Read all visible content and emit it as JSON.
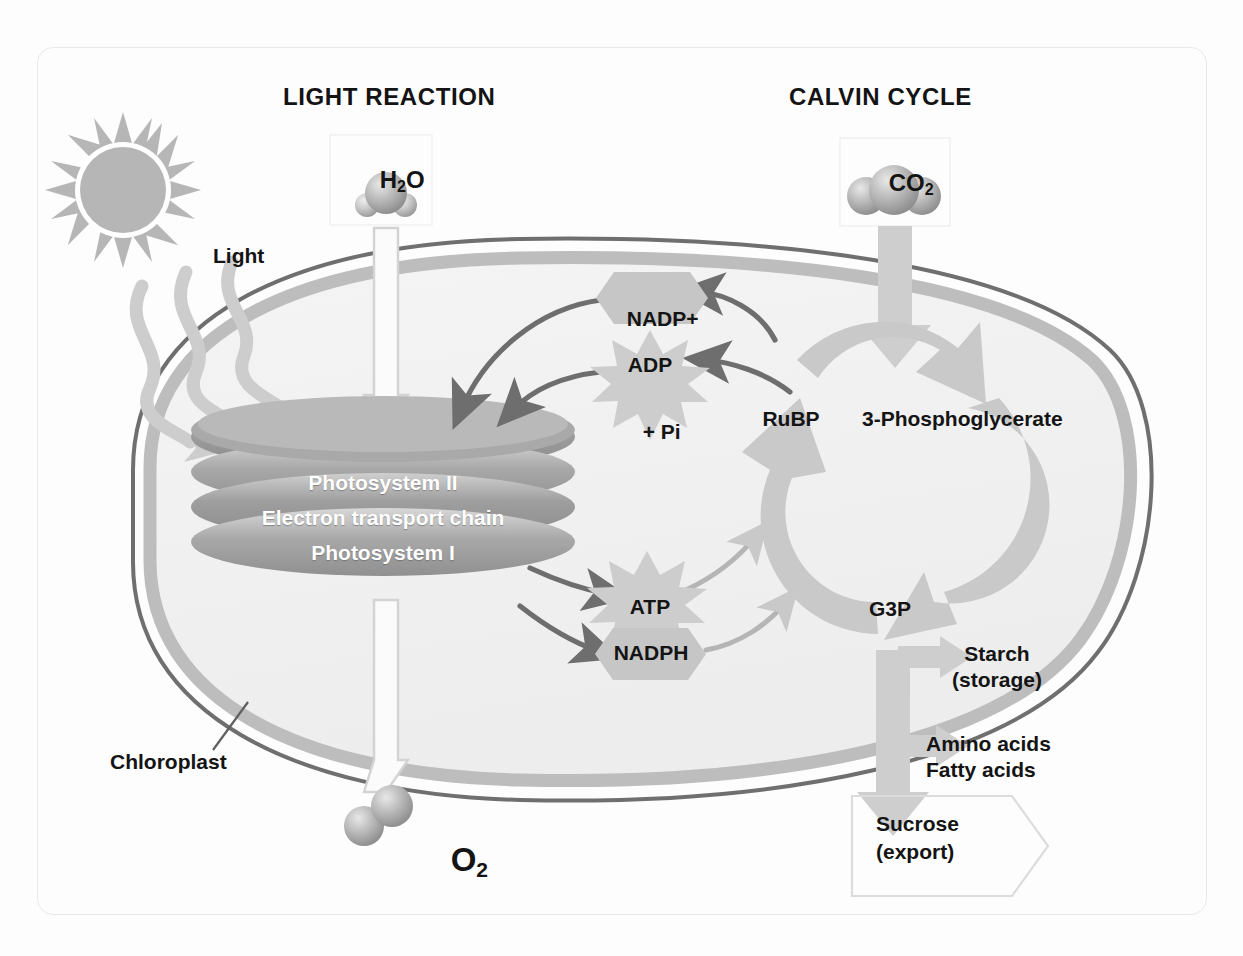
{
  "diagram": {
    "sections": {
      "left_heading": "LIGHT REACTION",
      "right_heading": "CALVIN CYCLE"
    },
    "inputs": {
      "water_label": "H",
      "water_sub": "2",
      "water_tail": "O",
      "co2_label": "CO",
      "co2_sub": "2",
      "light_label": "Light"
    },
    "outputs": {
      "oxygen_label": "O",
      "oxygen_sub": "2"
    },
    "thylakoid_stack": {
      "line1": "Photosystem II",
      "line2": "Electron transport chain",
      "line3": "Photosystem I"
    },
    "carriers": {
      "nadp_plus": "NADP",
      "nadp_plus_sup": "+",
      "adp": "ADP",
      "pi_prefix": "+ P",
      "pi_sub": "i",
      "atp": "ATP",
      "nadph": "NADPH"
    },
    "calvin": {
      "rubp": "RuBP",
      "pga": "3-Phosphoglycerate",
      "g3p": "G3P",
      "starch_line1": "Starch",
      "starch_line2": "(storage)",
      "amino_line1": "Amino acids",
      "amino_line2": "Fatty acids",
      "sucrose_line1": "Sucrose",
      "sucrose_line2": "(export)"
    },
    "structures": {
      "chloroplast_label": "Chloroplast"
    },
    "colors": {
      "background": "#fdfdfd",
      "frame_border": "#e9e9e9",
      "outer_membrane": "#6f6f6f",
      "inner_membrane": "#b9b9b9",
      "stroma_fill": "#efefef",
      "thylakoid_dark": "#8f8f8f",
      "thylakoid_light": "#bdbdbd",
      "pale_arrow": "#cfcfcf",
      "dark_arrow": "#6e6e6e",
      "sun_gray": "#b5b5b5",
      "burst_gray": "#cbcbcb",
      "hex_gray": "#c4c4c4",
      "text": "#141414",
      "thylakoid_text": "#ffffff"
    }
  }
}
